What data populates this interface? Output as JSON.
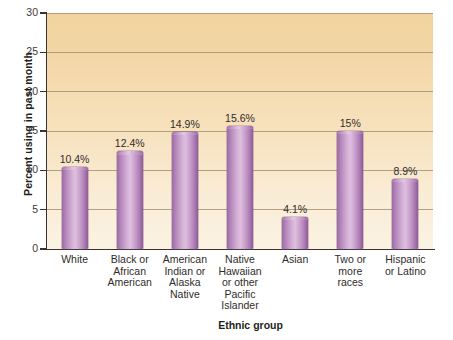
{
  "chart_data": {
    "type": "bar",
    "title": "",
    "xlabel": "Ethnic group",
    "ylabel": "Percent using in past month",
    "ylim": [
      0,
      30
    ],
    "yticks": [
      0,
      5,
      10,
      15,
      20,
      25,
      30
    ],
    "ytick_labels": [
      "0",
      "5",
      "10",
      "15",
      "20",
      "25",
      "30"
    ],
    "grid": true,
    "legend": "none",
    "categories": [
      "White",
      "Black or African American",
      "American Indian or Alaska Native",
      "Native Hawaiian or other Pacific Islander",
      "Asian",
      "Two or more races",
      "Hispanic or Latino"
    ],
    "category_lines": [
      [
        "White"
      ],
      [
        "Black or",
        "African",
        "American"
      ],
      [
        "American",
        "Indian or",
        "Alaska",
        "Native"
      ],
      [
        "Native",
        "Hawaiian",
        "or other",
        "Pacific",
        "Islander"
      ],
      [
        "Asian"
      ],
      [
        "Two or",
        "more",
        "races"
      ],
      [
        "Hispanic",
        "or Latino"
      ]
    ],
    "values": [
      10.4,
      12.4,
      14.9,
      15.6,
      4.1,
      15.0,
      8.9
    ],
    "value_labels": [
      "10.4%",
      "12.4%",
      "14.9%",
      "15.6%",
      "4.1%",
      "15%",
      "8.9%"
    ],
    "colors": {
      "bar_light": "#ddbede",
      "bar_dark": "#8d5c97",
      "plot_background_top": "#f2d3a0",
      "plot_background_bottom": "#fbf2e2",
      "gridline": "#a79271",
      "axis": "#3a3330",
      "text": "#231f20"
    }
  }
}
